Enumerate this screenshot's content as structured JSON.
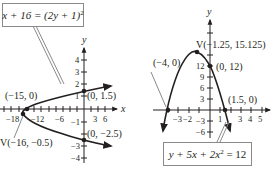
{
  "left_graph": {
    "equation": {
      "lhs": "x + 16 = (2y + 1)",
      "exp": "2"
    },
    "axis": {
      "x_label": "x",
      "y_label": "y"
    },
    "x_ticks": [
      "−18",
      "−12",
      "−6",
      "3",
      "6"
    ],
    "y_ticks": [
      "4",
      "3",
      "2",
      "1",
      "−1",
      "−3",
      "−4"
    ],
    "points": {
      "x_intercept": "(−15, 0)",
      "y_intercept_top": "(0, 1.5)",
      "y_intercept_bottom": "(0, −2.5)",
      "vertex": "V(−16, −0.5)"
    }
  },
  "right_graph": {
    "equation": {
      "pre": "y + 5x + 2x",
      "exp": "2",
      "post": " = 12"
    },
    "axis": {
      "y_label": "y"
    },
    "x_ticks": [
      "−3",
      "−2",
      "1",
      "3",
      "4",
      "5"
    ],
    "y_ticks": [
      "12",
      "9",
      "6",
      "3",
      "−3",
      "−6"
    ],
    "points": {
      "vertex": "V(−1.25, 15.125)",
      "y_intercept": "(0, 12)",
      "x_intercept_left": "(−4, 0)",
      "x_intercept_right": "(1.5, 0)"
    }
  },
  "colors": {
    "ink": "#231f20",
    "box_border": "#8a8a8a"
  }
}
